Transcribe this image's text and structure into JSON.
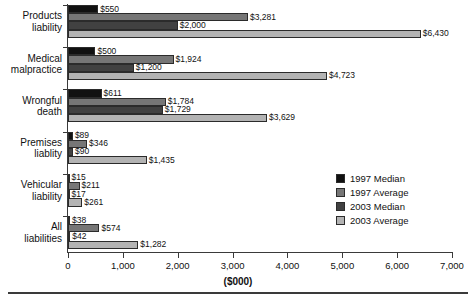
{
  "chart_data": {
    "type": "bar",
    "orientation": "horizontal",
    "title": "",
    "xlabel": "($000)",
    "ylabel": "",
    "xlim": [
      0,
      7000
    ],
    "xticks": [
      0,
      1000,
      2000,
      3000,
      4000,
      5000,
      6000,
      7000
    ],
    "xtick_labels": [
      "0",
      "1,000",
      "2,000",
      "3,000",
      "4,000",
      "5,000",
      "6,000",
      "7,000"
    ],
    "grid": false,
    "legend_position": "center-right",
    "categories": [
      "Products liability",
      "Medical malpractice",
      "Wrongful death",
      "Premises liability",
      "Vehicular liability",
      "All liabilities"
    ],
    "category_lines": [
      [
        "Products",
        "liability"
      ],
      [
        "Medical",
        "malpractice"
      ],
      [
        "Wrongful",
        "death"
      ],
      [
        "Premises",
        "liablity"
      ],
      [
        "Vehicular",
        "liability"
      ],
      [
        "All",
        "liabilities"
      ]
    ],
    "series": [
      {
        "name": "1997 Median",
        "color": "#111111",
        "values": [
          550,
          500,
          611,
          89,
          15,
          38
        ],
        "labels": [
          "$550",
          "$500",
          "$611",
          "$89",
          "$15",
          "$38"
        ]
      },
      {
        "name": "1997 Average",
        "color": "#767676",
        "values": [
          3281,
          1924,
          1784,
          346,
          211,
          574
        ],
        "labels": [
          "$3,281",
          "$1,924",
          "$1,784",
          "$346",
          "$211",
          "$574"
        ]
      },
      {
        "name": "2003 Median",
        "color": "#414141",
        "values": [
          2000,
          1200,
          1729,
          90,
          17,
          42
        ],
        "labels": [
          "$2,000",
          "$1,200",
          "$1,729",
          "$90",
          "$17",
          "$42"
        ]
      },
      {
        "name": "2003 Average",
        "color": "#b3b3b3",
        "values": [
          6430,
          4723,
          3629,
          1435,
          261,
          1282
        ],
        "labels": [
          "$6,430",
          "$4,723",
          "$3,629",
          "$1,435",
          "$261",
          "$1,282"
        ]
      }
    ]
  },
  "legend": {
    "items": [
      {
        "label": "1997 Median",
        "swatch": "s0"
      },
      {
        "label": "1997 Average",
        "swatch": "s1"
      },
      {
        "label": "2003 Median",
        "swatch": "s2"
      },
      {
        "label": "2003 Average",
        "swatch": "s3"
      }
    ]
  }
}
